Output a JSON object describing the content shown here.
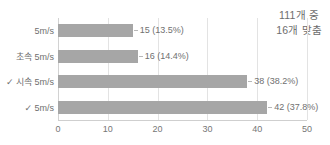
{
  "annotation": {
    "line1": "111개 중",
    "line2": "16개 맞춤"
  },
  "colors": {
    "bar": "#a6a6a6",
    "grid": "#e3e3e3",
    "axis": "#cfcfcf",
    "text": "#6f6f6f"
  },
  "chart_data": {
    "type": "bar",
    "orientation": "horizontal",
    "title": "",
    "xlabel": "",
    "ylabel": "",
    "xlim": [
      0,
      50
    ],
    "xticks": [
      "0",
      "10",
      "20",
      "30",
      "40",
      "50"
    ],
    "grid": true,
    "legend": false,
    "total": 111,
    "categories": [
      "5m/s",
      "초속 5m/s",
      "✓ 시속 5m/s",
      "✓ 5m/s"
    ],
    "values": [
      15,
      16,
      38,
      42
    ],
    "percents": [
      "13.5%",
      "14.4%",
      "38.2%",
      "37.8%"
    ],
    "data_labels": [
      "15 (13.5%)",
      "16 (14.4%)",
      "38 (38.2%)",
      "42 (37.8%)"
    ]
  }
}
